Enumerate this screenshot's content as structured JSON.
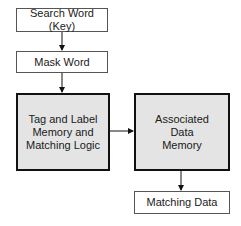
{
  "diagram": {
    "nodes": [
      {
        "id": "search_word",
        "label": "Search Word (Key)"
      },
      {
        "id": "mask_word",
        "label": "Mask Word"
      },
      {
        "id": "tag_label",
        "label": "Tag and Label Memory and Matching Logic"
      },
      {
        "id": "assoc_data",
        "label": "Associated Data Memory"
      },
      {
        "id": "matching_data",
        "label": "Matching Data"
      }
    ],
    "edges": [
      {
        "from": "search_word",
        "to": "mask_word"
      },
      {
        "from": "mask_word",
        "to": "tag_label"
      },
      {
        "from": "tag_label",
        "to": "assoc_data"
      },
      {
        "from": "assoc_data",
        "to": "matching_data"
      }
    ],
    "colors": {
      "highlight_fill": "#e4e4e4",
      "border": "#111111"
    }
  }
}
